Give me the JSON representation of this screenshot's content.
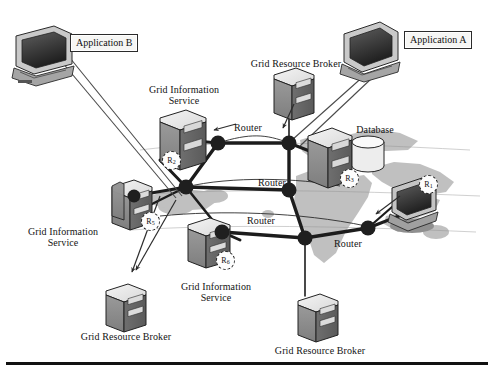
{
  "figure": {
    "type": "network-diagram",
    "background_map": "world-map-africa-europe-gray"
  },
  "application_boxes": [
    {
      "id": "app-b",
      "label": "Application B",
      "x": 70,
      "y": 34
    },
    {
      "id": "app-a",
      "label": "Application A",
      "x": 404,
      "y": 31
    }
  ],
  "labels": [
    {
      "id": "gis-top",
      "text": "Grid Information",
      "x": 184,
      "y": 84,
      "size": "sz10"
    },
    {
      "id": "gis-top-2",
      "text": "Service",
      "x": 184,
      "y": 95,
      "size": "sz10"
    },
    {
      "id": "grb-top",
      "text": "Grid Resource Broker",
      "x": 296,
      "y": 58,
      "size": "sz10"
    },
    {
      "id": "database",
      "text": "Database",
      "x": 375,
      "y": 124,
      "size": "sz10"
    },
    {
      "id": "router-1",
      "text": "Router",
      "x": 248,
      "y": 122,
      "size": "sz10"
    },
    {
      "id": "router-2",
      "text": "Router",
      "x": 272,
      "y": 177,
      "size": "sz10"
    },
    {
      "id": "router-3",
      "text": "Router",
      "x": 261,
      "y": 215,
      "size": "sz10"
    },
    {
      "id": "router-4",
      "text": "Router",
      "x": 348,
      "y": 238,
      "size": "sz10"
    },
    {
      "id": "gis-left",
      "text": "Grid Information",
      "x": 63,
      "y": 226,
      "size": "sz10"
    },
    {
      "id": "gis-left-2",
      "text": "Service",
      "x": 63,
      "y": 237,
      "size": "sz10"
    },
    {
      "id": "gis-mid",
      "text": "Grid Information",
      "x": 216,
      "y": 281,
      "size": "sz10"
    },
    {
      "id": "gis-mid-2",
      "text": "Service",
      "x": 216,
      "y": 292,
      "size": "sz10"
    },
    {
      "id": "grb-left",
      "text": "Grid Resource Broker",
      "x": 126,
      "y": 331,
      "size": "sz10"
    },
    {
      "id": "grb-right",
      "text": "Grid Resource Broker",
      "x": 320,
      "y": 345,
      "size": "sz10"
    }
  ],
  "router_badges": [
    {
      "id": "r1",
      "label": "R",
      "sub": "1",
      "x": 419,
      "y": 175
    },
    {
      "id": "r2",
      "label": "R",
      "sub": "2",
      "x": 162,
      "y": 151
    },
    {
      "id": "r3",
      "label": "R",
      "sub": "3",
      "x": 340,
      "y": 169
    },
    {
      "id": "r5",
      "label": "R",
      "sub": "5",
      "x": 141,
      "y": 212
    },
    {
      "id": "r6",
      "label": "R",
      "sub": "6",
      "x": 216,
      "y": 251
    }
  ],
  "nodes": [
    {
      "id": "node-nw",
      "x": 218,
      "y": 143,
      "r": 7.5
    },
    {
      "id": "node-ne",
      "x": 289,
      "y": 143,
      "r": 7.5
    },
    {
      "id": "node-mid-w",
      "x": 186,
      "y": 187,
      "r": 7.5
    },
    {
      "id": "node-mid-c",
      "x": 289,
      "y": 190,
      "r": 7.5
    },
    {
      "id": "node-sw",
      "x": 222,
      "y": 232,
      "r": 7.5
    },
    {
      "id": "node-s",
      "x": 305,
      "y": 238,
      "r": 7.5
    },
    {
      "id": "node-se",
      "x": 368,
      "y": 228,
      "r": 7.5
    }
  ],
  "colors": {
    "line": "#1c1c1c",
    "server_face": "#8d8d8d",
    "server_side": "#6a6a6a",
    "server_top": "#ececec",
    "map_land": "#a9a9a9",
    "background": "#ffffff",
    "rule": "#111111"
  }
}
